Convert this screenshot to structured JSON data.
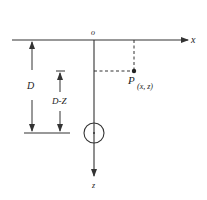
{
  "diagram": {
    "title": "",
    "colors": {
      "stroke": "#333333",
      "text": "#222222",
      "background": "#ffffff"
    },
    "labels": {
      "origin": "o",
      "x_axis": "x",
      "z_axis": "z",
      "point_name": "P",
      "point_coords": "(x, z)",
      "depth": "D",
      "depth_minus_z": "D-Z"
    },
    "elements": [
      {
        "id": "x-axis",
        "type": "arrow-line",
        "from": [
          12,
          40
        ],
        "to": [
          188,
          40
        ]
      },
      {
        "id": "z-axis",
        "type": "arrow-line",
        "from": [
          94,
          40
        ],
        "to": [
          94,
          176
        ]
      },
      {
        "id": "point-p",
        "type": "point",
        "at": [
          134,
          71
        ]
      },
      {
        "id": "p-vertical-projection",
        "type": "dashed-line",
        "from": [
          134,
          40
        ],
        "to": [
          134,
          71
        ]
      },
      {
        "id": "p-horizontal-projection",
        "type": "dashed-line",
        "from": [
          94,
          71
        ],
        "to": [
          134,
          71
        ]
      },
      {
        "id": "source-circle",
        "type": "circle",
        "center": [
          94,
          133
        ],
        "radius": 10
      },
      {
        "id": "depth-baseline",
        "type": "line",
        "from": [
          24,
          133
        ],
        "to": [
          70,
          133
        ]
      },
      {
        "id": "depth-dimension-D",
        "type": "double-arrow",
        "x": 32,
        "from_y": 40,
        "to_y": 133
      },
      {
        "id": "depth-dimension-D-Z",
        "type": "double-arrow",
        "x": 60,
        "from_y": 71,
        "to_y": 133
      }
    ]
  }
}
